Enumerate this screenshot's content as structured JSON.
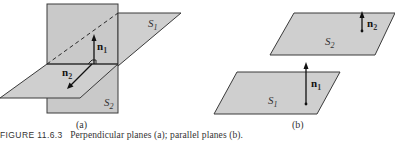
{
  "figure": {
    "number_label": "FIGURE 11.6.3",
    "caption": "Perpendicular planes (a); parallel planes (b)."
  },
  "panel_a": {
    "label": "(a)",
    "plane_horizontal": {
      "name": "S",
      "sub": "1"
    },
    "plane_vertical": {
      "name": "S",
      "sub": "2"
    },
    "vector_up": {
      "name": "n",
      "sub": "1"
    },
    "vector_out": {
      "name": "n",
      "sub": "2"
    }
  },
  "panel_b": {
    "label": "(b)",
    "plane_upper": {
      "name": "S",
      "sub": "2"
    },
    "plane_lower": {
      "name": "S",
      "sub": "1"
    },
    "vector_upper": {
      "name": "n",
      "sub": "2"
    },
    "vector_lower": {
      "name": "n",
      "sub": "1"
    }
  },
  "colors": {
    "plane_fill": "#cfcfcf",
    "edge": "#3a3a3a",
    "vector": "#111111"
  }
}
